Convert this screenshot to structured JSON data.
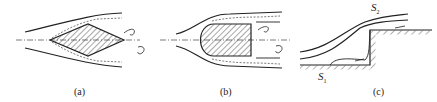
{
  "figure": {
    "panels": [
      {
        "id": "a",
        "caption": "(a)",
        "shape": "diamond body (wedge-shaped, symmetric)"
      },
      {
        "id": "b",
        "caption": "(b)",
        "shape": "blunt-nosed body with flat base"
      },
      {
        "id": "c",
        "caption": "(c)",
        "shape": "backward/forward facing step",
        "labels": {
          "s1": "S",
          "s1_sub": "1",
          "s2": "S",
          "s2_sub": "2"
        }
      }
    ]
  },
  "colors": {
    "stroke": "#222222",
    "background": "#ffffff"
  }
}
